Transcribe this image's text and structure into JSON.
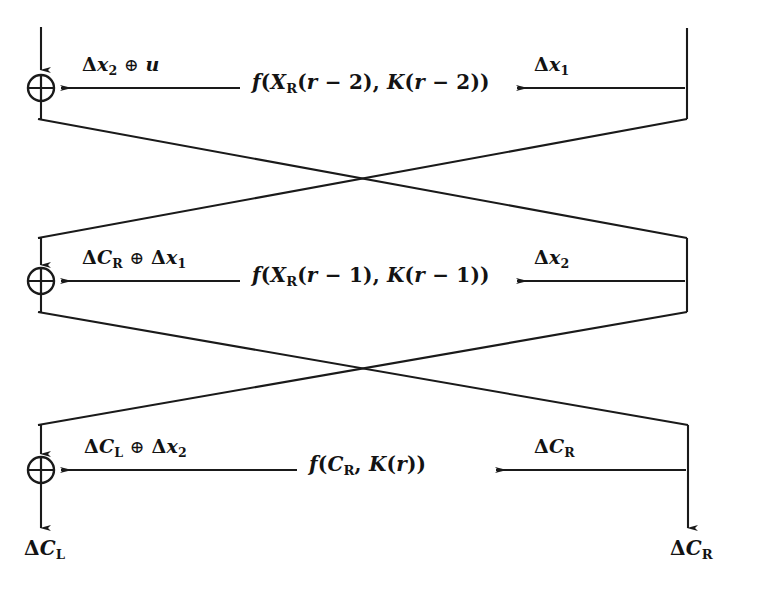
{
  "figure": {
    "line_color": "#1a1a1a",
    "background": "#ffffff",
    "text_color": "#131313"
  },
  "rounds": [
    {
      "id": "round-r-minus-2",
      "xor_name": "xor-round-r-minus-2",
      "left_label": {
        "text": "Δx₂ ⊕ u",
        "parts": {
          "delta": "Δ",
          "var": "x",
          "sub": "2",
          "op": "⊕",
          "operand": "u"
        }
      },
      "function_label": {
        "text": "f(XR(r − 2), K(r − 2))",
        "parts": {
          "f": "f",
          "state": "X",
          "state_sub": "R",
          "round_expr": "r − 2",
          "key": "K",
          "key_expr": "r − 2"
        }
      },
      "right_label": {
        "text": "Δx₁",
        "parts": {
          "delta": "Δ",
          "var": "x",
          "sub": "1"
        }
      }
    },
    {
      "id": "round-r-minus-1",
      "xor_name": "xor-round-r-minus-1",
      "left_label": {
        "text": "ΔCR ⊕ Δx₁",
        "parts": {
          "delta": "Δ",
          "var": "C",
          "sub": "R",
          "op": "⊕",
          "operand_delta": "Δ",
          "operand": "x",
          "operand_sub": "1"
        }
      },
      "function_label": {
        "text": "f(XR(r − 1), K(r − 1))",
        "parts": {
          "f": "f",
          "state": "X",
          "state_sub": "R",
          "round_expr": "r − 1",
          "key": "K",
          "key_expr": "r − 1"
        }
      },
      "right_label": {
        "text": "Δx₂",
        "parts": {
          "delta": "Δ",
          "var": "x",
          "sub": "2"
        }
      }
    },
    {
      "id": "round-r",
      "xor_name": "xor-round-r",
      "left_label": {
        "text": "ΔCL ⊕ Δx₂",
        "parts": {
          "delta": "Δ",
          "var": "C",
          "sub": "L",
          "op": "⊕",
          "operand_delta": "Δ",
          "operand": "x",
          "operand_sub": "2"
        }
      },
      "function_label": {
        "text": "f(CR, K(r))",
        "parts": {
          "f": "f",
          "state": "C",
          "state_sub": "R",
          "key": "K",
          "key_expr": "r"
        }
      },
      "right_label": {
        "text": "ΔCR",
        "parts": {
          "delta": "Δ",
          "var": "C",
          "sub": "R"
        }
      }
    }
  ],
  "outputs": [
    {
      "id": "output-left",
      "text": "ΔCL",
      "parts": {
        "delta": "Δ",
        "var": "C",
        "sub": "L"
      }
    },
    {
      "id": "output-right",
      "text": "ΔCR",
      "parts": {
        "delta": "Δ",
        "var": "C",
        "sub": "R"
      }
    }
  ]
}
